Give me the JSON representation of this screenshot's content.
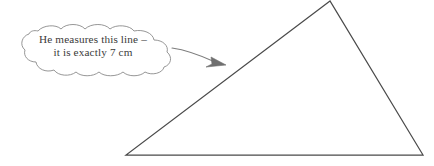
{
  "figure": {
    "caption_bubble": {
      "shape": "thought-cloud",
      "line1": "He measures this line –",
      "line2": "it is exactly 7 cm",
      "outline_color": "#8a8a8a",
      "fill_color": "#ffffff",
      "text_color": "#3a3a3a"
    },
    "pointer": {
      "type": "curved-arrow",
      "color": "#7d7d7d",
      "from": "bubble-right-edge",
      "to": "triangle-left-side"
    },
    "triangle": {
      "stroke_color": "#4a4a4a",
      "fill": "none",
      "vertices": [
        {
          "name": "apex",
          "x": 330,
          "y": 2
        },
        {
          "name": "bottom-left",
          "x": 126,
          "y": 155
        },
        {
          "name": "bottom-right",
          "x": 423,
          "y": 155
        }
      ]
    }
  }
}
